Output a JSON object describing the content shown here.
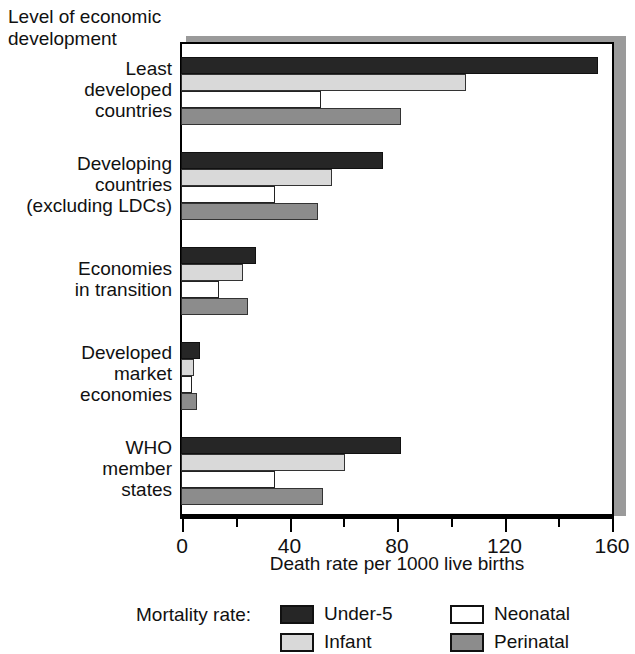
{
  "chart_data": {
    "type": "bar",
    "orientation": "horizontal",
    "title": "Level of economic development",
    "xlabel": "Death rate per 1000 live births",
    "ylabel": "Level of economic development",
    "xlim": [
      0,
      160
    ],
    "xticks": [
      0,
      40,
      80,
      120,
      160
    ],
    "xtick_labels": [
      "0",
      "40",
      "80",
      "120",
      "160"
    ],
    "minor_xticks": [
      20,
      60,
      100,
      140
    ],
    "grid": false,
    "legend_position": "bottom",
    "legend_title": "Mortality rate:",
    "categories": [
      "Least developed countries",
      "Developing countries (excluding LDCs)",
      "Economies in transition",
      "Developed market economies",
      "WHO member states"
    ],
    "series": [
      {
        "name": "Under-5",
        "color": "#262626",
        "values": [
          155,
          75,
          28,
          7,
          82
        ]
      },
      {
        "name": "Infant",
        "color": "#d9d9d9",
        "values": [
          106,
          56,
          23,
          5,
          61
        ]
      },
      {
        "name": "Neonatal",
        "color": "#ffffff",
        "values": [
          52,
          35,
          14,
          4,
          35
        ]
      },
      {
        "name": "Perinatal",
        "color": "#8c8c8c",
        "values": [
          82,
          51,
          25,
          6,
          53
        ]
      }
    ]
  },
  "axis_title": {
    "line1": "Level of economic",
    "line2": "development"
  },
  "category_labels": [
    {
      "lines": [
        "Least",
        "developed",
        "countries"
      ]
    },
    {
      "lines": [
        "Developing",
        "countries",
        "(excluding LDCs)"
      ]
    },
    {
      "lines": [
        "Economies",
        "in transition"
      ]
    },
    {
      "lines": [
        "Developed",
        "market",
        "economies"
      ]
    },
    {
      "lines": [
        "WHO",
        "member",
        "states"
      ]
    }
  ],
  "x_axis": {
    "label": "Death rate per 1000 live births",
    "ticks": [
      "0",
      "40",
      "80",
      "120",
      "160"
    ]
  },
  "legend": {
    "title": "Mortality rate:",
    "items": [
      {
        "label": "Under-5",
        "swatch": "under5"
      },
      {
        "label": "Neonatal",
        "swatch": "neonatal"
      },
      {
        "label": "Infant",
        "swatch": "infant"
      },
      {
        "label": "Perinatal",
        "swatch": "perinatal"
      }
    ]
  }
}
